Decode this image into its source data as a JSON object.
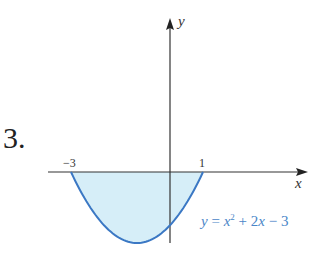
{
  "problem_number": "3.",
  "chart_data": {
    "type": "area",
    "title": "",
    "xlabel": "x",
    "ylabel": "y",
    "function": "y = x^2 + 2x - 3",
    "x_intercepts": [
      -3,
      1
    ],
    "y_intercept": -3,
    "vertex": [
      -1,
      -4
    ],
    "shaded_region": "between curve and x-axis from x = -3 to x = 1",
    "x": [
      -3,
      -2.5,
      -2,
      -1.5,
      -1,
      -0.5,
      0,
      0.5,
      1
    ],
    "series": [
      {
        "name": "y = x^2 + 2x - 3",
        "values": [
          0,
          -1.75,
          -3,
          -3.75,
          -4,
          -3.75,
          -3,
          -1.75,
          0
        ]
      }
    ],
    "tick_labels": {
      "x": [
        "-3",
        "1"
      ]
    },
    "grid": false,
    "colors": {
      "curve": "#3b78c4",
      "fill": "#d6eef8",
      "label": "#4a86c8",
      "axes": "#333333"
    }
  },
  "labels": {
    "tick_neg3": "−3",
    "tick_1": "1",
    "x_axis": "x",
    "y_axis": "y",
    "eq_y": "y",
    "eq_eqsign": " = ",
    "eq_x": "x",
    "eq_exp": "2",
    "eq_rest1": " + 2",
    "eq_x2": "x",
    "eq_rest2": " − 3"
  }
}
